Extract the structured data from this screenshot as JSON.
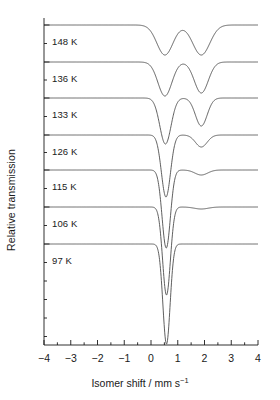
{
  "chart_data": {
    "type": "line",
    "title": "",
    "subtitle": "",
    "xlabel_text": "Isomer shift / mm s",
    "xlabel_exponent": "−1",
    "ylabel": "Relative transmission",
    "xlim": [
      -4,
      4
    ],
    "xtick_labels": [
      "−4",
      "−3",
      "−2",
      "−1",
      "0",
      "1",
      "2",
      "3",
      "4"
    ],
    "xtick_values": [
      -4,
      -3,
      -2,
      -1,
      0,
      1,
      2,
      3,
      4
    ],
    "xminor_step": 0.5,
    "ylim": [
      0,
      1
    ],
    "ytick_labels": [],
    "grid": false,
    "legend_position": "inline-left",
    "annotation_note": "Stacked Mössbauer spectra offset vertically; each trace annotated with its measurement temperature.",
    "series": [
      {
        "name": "148 K",
        "label": "148 K",
        "baseline_y": 25,
        "label_x": 52,
        "label_y": 36,
        "peaks": [
          {
            "center": 0.52,
            "depth": 30,
            "width": 0.3
          },
          {
            "center": 1.88,
            "depth": 30,
            "width": 0.32
          }
        ]
      },
      {
        "name": "136 K",
        "label": "136 K",
        "baseline_y": 62,
        "label_x": 52,
        "label_y": 73,
        "peaks": [
          {
            "center": 0.52,
            "depth": 34,
            "width": 0.26
          },
          {
            "center": 1.88,
            "depth": 31,
            "width": 0.26
          }
        ]
      },
      {
        "name": "133 K",
        "label": "133 K",
        "baseline_y": 98,
        "label_x": 52,
        "label_y": 109,
        "peaks": [
          {
            "center": 0.54,
            "depth": 46,
            "width": 0.21
          },
          {
            "center": 1.88,
            "depth": 28,
            "width": 0.22
          }
        ]
      },
      {
        "name": "126 K",
        "label": "126 K",
        "baseline_y": 135,
        "label_x": 52,
        "label_y": 146,
        "peaks": [
          {
            "center": 0.56,
            "depth": 62,
            "width": 0.17
          },
          {
            "center": 1.88,
            "depth": 12,
            "width": 0.22
          }
        ]
      },
      {
        "name": "115 K",
        "label": "115 K",
        "baseline_y": 170,
        "label_x": 52,
        "label_y": 181,
        "peaks": [
          {
            "center": 0.57,
            "depth": 78,
            "width": 0.155
          },
          {
            "center": 1.88,
            "depth": 5,
            "width": 0.24
          }
        ]
      },
      {
        "name": "106 K",
        "label": "106 K",
        "baseline_y": 207,
        "label_x": 52,
        "label_y": 218,
        "peaks": [
          {
            "center": 0.58,
            "depth": 88,
            "width": 0.145
          },
          {
            "center": 1.88,
            "depth": 2,
            "width": 0.26
          }
        ]
      },
      {
        "name": "97 K",
        "label": "97 K",
        "baseline_y": 244,
        "label_x": 52,
        "label_y": 255,
        "peaks": [
          {
            "center": 0.58,
            "depth": 100,
            "width": 0.135
          }
        ]
      }
    ],
    "colors": {
      "trace": "#4d4d4d",
      "axis": "#1a1a1a",
      "background": "#ffffff",
      "text": "#1a1a1a"
    }
  },
  "axes": {
    "x_pixel_min": 44,
    "x_pixel_max": 258,
    "axis_line_y": 345,
    "y_axis_x": 44,
    "y_top": 18
  }
}
